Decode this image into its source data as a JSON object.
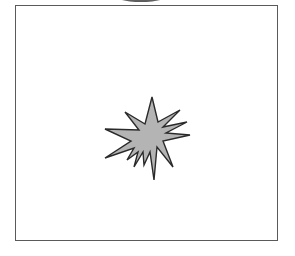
{
  "figure": {
    "type": "starburst-illustration",
    "frame": {
      "stroke": "#5a5a5a"
    },
    "shape": {
      "name": "starburst",
      "fill": "#b4b4b4",
      "stroke": "#2a2a2a"
    },
    "top_element": {
      "name": "dark-arc",
      "color": "#6a6a6a"
    }
  }
}
